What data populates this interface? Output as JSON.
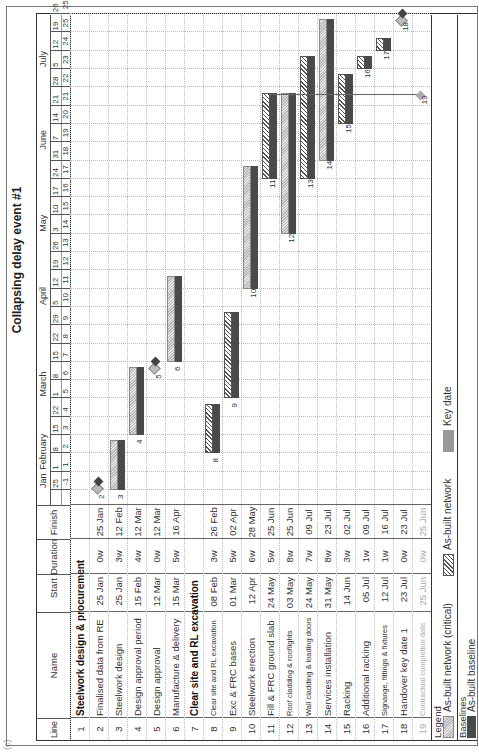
{
  "corner_label": "(c)",
  "title": "Collapsing delay event #1",
  "table": {
    "headers": {
      "line": "Line",
      "name": "Name",
      "start": "Start",
      "duration": "Duration",
      "finish": "Finish"
    },
    "rows": [
      {
        "line": "1",
        "name": "Steelwork design & procurement",
        "start": "",
        "duration": "",
        "finish": "",
        "summary": true
      },
      {
        "line": "2",
        "name": "Finalised data from RE",
        "start": "25 Jan",
        "duration": "0w",
        "finish": "25 Jan"
      },
      {
        "line": "3",
        "name": "Steelwork design",
        "start": "25 Jan",
        "duration": "3w",
        "finish": "12 Feb"
      },
      {
        "line": "4",
        "name": "Design approval period",
        "start": "15 Feb",
        "duration": "4w",
        "finish": "12 Mar"
      },
      {
        "line": "5",
        "name": "Design approval",
        "start": "12 Mar",
        "duration": "0w",
        "finish": "12 Mar"
      },
      {
        "line": "6",
        "name": "Manufacture & delivery",
        "start": "15 Mar",
        "duration": "5w",
        "finish": "16 Apr"
      },
      {
        "line": "7",
        "name": "Clear site and RL excavation",
        "start": "",
        "duration": "",
        "finish": "",
        "summary": true
      },
      {
        "line": "8",
        "name": "Clear site and RL excavation",
        "start": "08 Feb",
        "duration": "3w",
        "finish": "26 Feb"
      },
      {
        "line": "9",
        "name": "Exc & FRC bases",
        "start": "01 Mar",
        "duration": "5w",
        "finish": "02 Apr"
      },
      {
        "line": "10",
        "name": "Steelwork erection",
        "start": "12 Apr",
        "duration": "6w",
        "finish": "28 May"
      },
      {
        "line": "11",
        "name": "Fill & FRC ground slab",
        "start": "24 May",
        "duration": "5w",
        "finish": "25 Jun"
      },
      {
        "line": "12",
        "name": "Roof cladding & rooflights",
        "start": "03 May",
        "duration": "8w",
        "finish": "25 Jun"
      },
      {
        "line": "13",
        "name": "Wall cladding & loading doors",
        "start": "24 May",
        "duration": "7w",
        "finish": "09 Jul"
      },
      {
        "line": "14",
        "name": "Services installation",
        "start": "31 May",
        "duration": "8w",
        "finish": "23 Jul"
      },
      {
        "line": "15",
        "name": "Racking",
        "start": "14 Jun",
        "duration": "3w",
        "finish": "02 Jul"
      },
      {
        "line": "16",
        "name": "Additional racking",
        "start": "05 Jul",
        "duration": "1w",
        "finish": "09 Jul"
      },
      {
        "line": "17",
        "name": "Signange, fittings & fixtures",
        "start": "12 Jul",
        "duration": "1w",
        "finish": "16 Jul"
      },
      {
        "line": "18",
        "name": "Handover key date 1",
        "start": "23 Jul",
        "duration": "0w",
        "finish": "23 Jul"
      },
      {
        "line": "19",
        "name": "Contractual completion date",
        "start": "25 Jun",
        "duration": "0w",
        "finish": "25 Jun",
        "faded": true
      }
    ]
  },
  "timescale": {
    "months": [
      {
        "label": "Jan",
        "week": 0
      },
      {
        "label": "February",
        "week": 1
      },
      {
        "label": "March",
        "week": 5
      },
      {
        "label": "April",
        "week": 10
      },
      {
        "label": "May",
        "week": 14
      },
      {
        "label": "June",
        "week": 18.5
      },
      {
        "label": "July",
        "week": 23
      }
    ],
    "dates": [
      "25",
      "1",
      "8",
      "15",
      "22",
      "1",
      "8",
      "15",
      "22",
      "29",
      "5",
      "12",
      "19",
      "26",
      "3",
      "10",
      "17",
      "24",
      "31",
      "7",
      "14",
      "21",
      "28",
      "5",
      "12",
      "19",
      "26"
    ],
    "weeks": [
      "-1",
      "1",
      "2",
      "3",
      "4",
      "5",
      "6",
      "7",
      "8",
      "9",
      "10",
      "11",
      "12",
      "13",
      "14",
      "15",
      "16",
      "17",
      "18",
      "19",
      "20",
      "21",
      "22",
      "23",
      "24",
      "25",
      "25"
    ]
  },
  "legend": {
    "label": "Legend",
    "items": [
      {
        "label": "As-built network (critical)",
        "style": "critical"
      },
      {
        "label": "As-built network",
        "style": "network"
      },
      {
        "label": "Key date",
        "style": "keydate"
      }
    ],
    "baselines_label": "Baselines",
    "baselines": [
      {
        "label": "As-built baseline",
        "style": "baseline"
      }
    ]
  },
  "colors": {
    "baseline": "#4a4a4a",
    "critical": "#c8c8c8",
    "network": "#555555",
    "keydate": "#999999"
  },
  "chart_data": {
    "type": "gantt",
    "title": "Collapsing delay event #1",
    "x_axis": "Calendar weeks (25 Jan - 26 Jul)",
    "tasks": [
      {
        "line": 2,
        "name": "Finalised data from RE",
        "start": "25 Jan",
        "finish": "25 Jan",
        "kind": "milestone"
      },
      {
        "line": 3,
        "name": "Steelwork design",
        "start": "25 Jan",
        "finish": "12 Feb",
        "kind": "critical"
      },
      {
        "line": 4,
        "name": "Design approval period",
        "start": "15 Feb",
        "finish": "12 Mar",
        "kind": "critical"
      },
      {
        "line": 5,
        "name": "Design approval",
        "start": "12 Mar",
        "finish": "12 Mar",
        "kind": "milestone"
      },
      {
        "line": 6,
        "name": "Manufacture & delivery",
        "start": "15 Mar",
        "finish": "16 Apr",
        "kind": "critical"
      },
      {
        "line": 8,
        "name": "Clear site and RL excavation",
        "start": "08 Feb",
        "finish": "26 Feb",
        "kind": "network"
      },
      {
        "line": 9,
        "name": "Exc & FRC bases",
        "start": "01 Mar",
        "finish": "02 Apr",
        "kind": "network"
      },
      {
        "line": 10,
        "name": "Steelwork erection",
        "start": "12 Apr",
        "finish": "28 May",
        "kind": "critical"
      },
      {
        "line": 11,
        "name": "Fill & FRC ground slab",
        "start": "24 May",
        "finish": "25 Jun",
        "kind": "network"
      },
      {
        "line": 12,
        "name": "Roof cladding & rooflights",
        "start": "03 May",
        "finish": "25 Jun",
        "kind": "critical"
      },
      {
        "line": 13,
        "name": "Wall cladding & loading doors",
        "start": "24 May",
        "finish": "09 Jul",
        "kind": "network"
      },
      {
        "line": 14,
        "name": "Services installation",
        "start": "31 May",
        "finish": "23 Jul",
        "kind": "critical"
      },
      {
        "line": 15,
        "name": "Racking",
        "start": "14 Jun",
        "finish": "02 Jul",
        "kind": "network"
      },
      {
        "line": 16,
        "name": "Additional racking",
        "start": "05 Jul",
        "finish": "09 Jul",
        "kind": "network"
      },
      {
        "line": 17,
        "name": "Signange, fittings & fixtures",
        "start": "12 Jul",
        "finish": "16 Jul",
        "kind": "network"
      },
      {
        "line": 18,
        "name": "Handover key date 1",
        "start": "23 Jul",
        "finish": "23 Jul",
        "kind": "milestone"
      },
      {
        "line": 19,
        "name": "Contractual completion date",
        "start": "25 Jun",
        "finish": "25 Jun",
        "kind": "keydate"
      }
    ]
  }
}
